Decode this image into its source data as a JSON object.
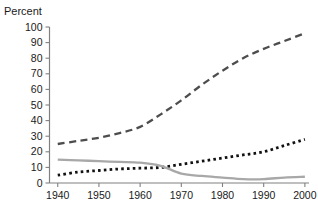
{
  "chart_data": {
    "type": "line",
    "title": "",
    "ylabel": "Percent",
    "xlabel": "",
    "ylim": [
      0,
      100
    ],
    "xlim": [
      1938,
      2001
    ],
    "grid": false,
    "legend": "none",
    "y_ticks": [
      0,
      10,
      20,
      30,
      40,
      50,
      60,
      70,
      80,
      90,
      100
    ],
    "y_tick_labels": [
      "0",
      "10",
      "20",
      "30",
      "40",
      "50",
      "60",
      "70",
      "80",
      "90",
      "100"
    ],
    "x_ticks": [
      1940,
      1950,
      1960,
      1970,
      1980,
      1990,
      2000
    ],
    "x_tick_labels": [
      "1940",
      "1950",
      "1960",
      "1970",
      "1980",
      "1990",
      "2000"
    ],
    "x": [
      1940,
      1945,
      1950,
      1955,
      1960,
      1965,
      1970,
      1975,
      1980,
      1985,
      1990,
      1995,
      2000
    ],
    "series": [
      {
        "name": "dashed-series",
        "style": "dashed",
        "color": "#4d4d4d",
        "values": [
          25,
          27,
          29,
          32,
          36,
          44,
          53,
          63,
          72,
          80,
          86,
          91,
          96
        ]
      },
      {
        "name": "dotted-series",
        "style": "dotted",
        "color": "#111111",
        "values": [
          5,
          7,
          8,
          9,
          9.5,
          10,
          12,
          14,
          16,
          18,
          20,
          24,
          28
        ]
      },
      {
        "name": "solid-gray-series",
        "style": "solid",
        "color": "#a8a8a8",
        "values": [
          15,
          14.5,
          14,
          13.5,
          13,
          11,
          6,
          4.5,
          3.5,
          2.5,
          2.5,
          3.5,
          4
        ]
      }
    ]
  },
  "axis": {
    "y_label": "Percent"
  }
}
